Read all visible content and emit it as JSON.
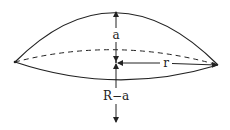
{
  "diagram": {
    "labels": {
      "height": "a",
      "radius": "r",
      "lower_distance": "R−a"
    },
    "colors": {
      "stroke": "#222222",
      "background": "#ffffff"
    }
  }
}
